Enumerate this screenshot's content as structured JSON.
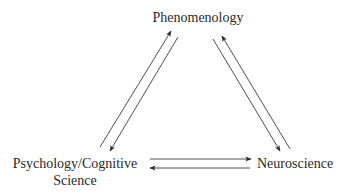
{
  "diagram": {
    "type": "triangle-cycle",
    "nodes": [
      {
        "id": "phenomenology",
        "label": "Phenomenology"
      },
      {
        "id": "psychology",
        "label_line1": "Psychology/Cognitive",
        "label_line2": "Science"
      },
      {
        "id": "neuroscience",
        "label": "Neuroscience"
      }
    ],
    "edges": [
      {
        "from": "psychology",
        "to": "phenomenology"
      },
      {
        "from": "phenomenology",
        "to": "psychology"
      },
      {
        "from": "phenomenology",
        "to": "neuroscience"
      },
      {
        "from": "neuroscience",
        "to": "phenomenology"
      },
      {
        "from": "psychology",
        "to": "neuroscience"
      },
      {
        "from": "neuroscience",
        "to": "psychology"
      }
    ],
    "colors": {
      "line": "#3a3a3a",
      "text": "#2a2a2a",
      "background": "#ffffff"
    }
  }
}
